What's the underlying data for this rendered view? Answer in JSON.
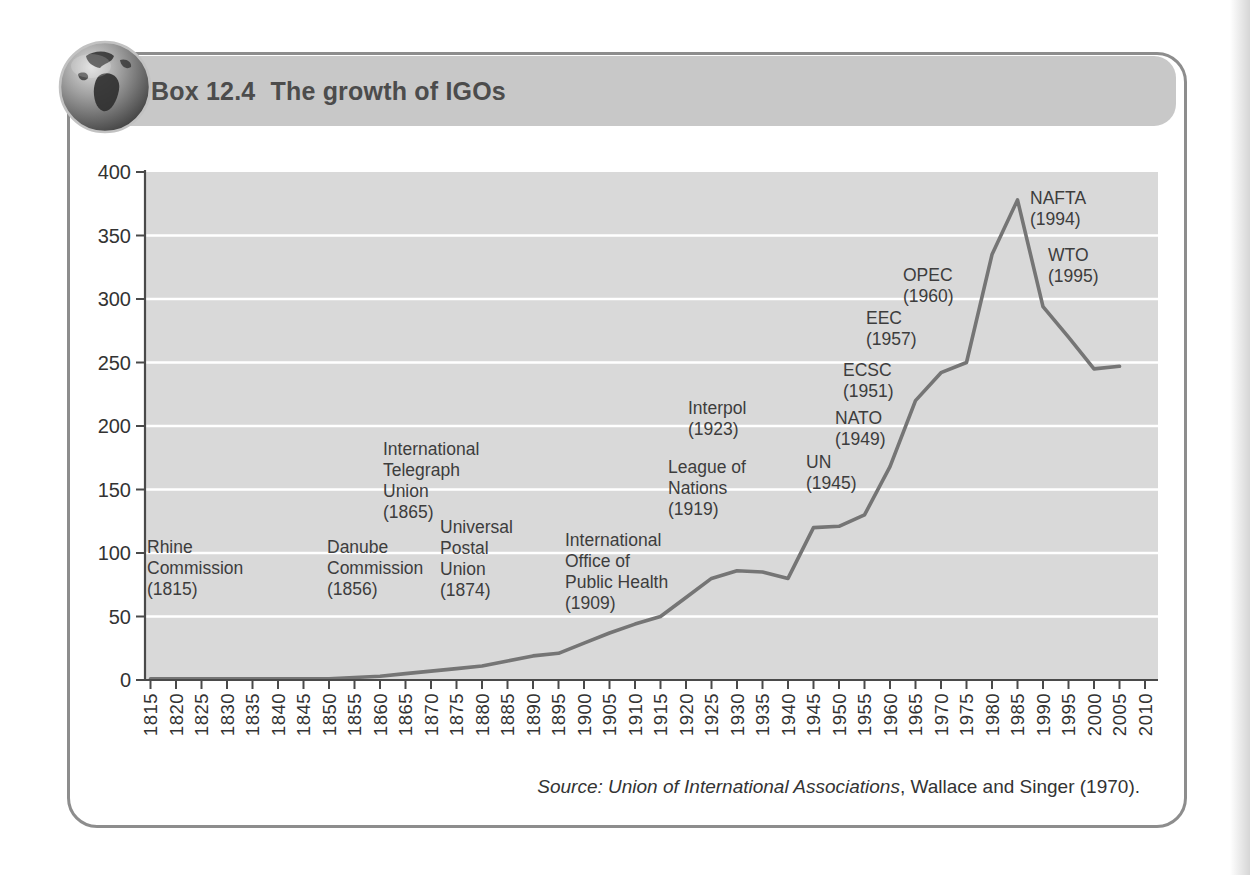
{
  "header": {
    "box_label": "Box 12.4",
    "title": "The growth of IGOs",
    "icon": "globe-icon"
  },
  "source": {
    "italic_part": "Source: Union of International Associations",
    "regular_part": ", Wallace and Singer (1970)."
  },
  "colors": {
    "band": "#c8c8c8",
    "box_border": "#8d8d8d",
    "title_text": "#4c4c4c",
    "plot_bg": "#d9d9d9",
    "gridline": "#ffffff",
    "axis": "#4a4a4a",
    "tick_text": "#333333",
    "line": "#757575",
    "annotation_text": "#3d3d3d",
    "source_text": "#333333"
  },
  "chart_data": {
    "type": "line",
    "title": "The growth of IGOs",
    "xlabel": "",
    "ylabel": "",
    "xlim": [
      1815,
      2010
    ],
    "ylim": [
      0,
      400
    ],
    "grid": "horizontal white gridlines every 50",
    "legend": "none",
    "y_ticks": [
      0,
      50,
      100,
      150,
      200,
      250,
      300,
      350,
      400
    ],
    "x_tick_labels": [
      "1815",
      "1820",
      "1825",
      "1830",
      "1835",
      "1840",
      "1845",
      "1850",
      "1855",
      "1860",
      "1865",
      "1870",
      "1875",
      "1880",
      "1885",
      "1890",
      "1895",
      "1900",
      "1905",
      "1910",
      "1915",
      "1920",
      "1925",
      "1930",
      "1935",
      "1940",
      "1945",
      "1950",
      "1955",
      "1960",
      "1965",
      "1970",
      "1975",
      "1980",
      "1985",
      "1990",
      "1995",
      "2000",
      "2005",
      "2010"
    ],
    "x": [
      1815,
      1820,
      1825,
      1830,
      1835,
      1840,
      1845,
      1850,
      1855,
      1860,
      1865,
      1870,
      1875,
      1880,
      1885,
      1890,
      1895,
      1900,
      1905,
      1910,
      1915,
      1920,
      1925,
      1930,
      1935,
      1940,
      1945,
      1950,
      1955,
      1960,
      1965,
      1970,
      1975,
      1980,
      1985,
      1990,
      1995,
      2000,
      2005
    ],
    "values": [
      1,
      1,
      1,
      1,
      1,
      1,
      1,
      1,
      2,
      3,
      5,
      7,
      9,
      11,
      15,
      19,
      21,
      29,
      37,
      44,
      50,
      65,
      80,
      86,
      85,
      80,
      120,
      121,
      130,
      168,
      220,
      242,
      250,
      335,
      378,
      294,
      270,
      245,
      247
    ],
    "annotations": [
      {
        "label": "Rhine Commission (1815)",
        "lines": [
          "Rhine",
          "Commission",
          "(1815)"
        ],
        "x": 147,
        "y": 553
      },
      {
        "label": "Danube Commission (1856)",
        "lines": [
          "Danube",
          "Commission",
          "(1856)"
        ],
        "x": 327,
        "y": 553
      },
      {
        "label": "International Telegraph Union (1865)",
        "lines": [
          "International",
          "Telegraph",
          "Union",
          "(1865)"
        ],
        "x": 383,
        "y": 455
      },
      {
        "label": "Universal Postal Union (1874)",
        "lines": [
          "Universal",
          "Postal",
          "Union",
          "(1874)"
        ],
        "x": 440,
        "y": 533
      },
      {
        "label": "International Office of Public Health (1909)",
        "lines": [
          "International",
          "Office of",
          "Public Health",
          "(1909)"
        ],
        "x": 565,
        "y": 546
      },
      {
        "label": "League of Nations (1919)",
        "lines": [
          "League of",
          "Nations",
          "(1919)"
        ],
        "x": 668,
        "y": 473
      },
      {
        "label": "Interpol (1923)",
        "lines": [
          "Interpol",
          "(1923)"
        ],
        "x": 688,
        "y": 414
      },
      {
        "label": "UN (1945)",
        "lines": [
          "UN",
          "(1945)"
        ],
        "x": 806,
        "y": 468
      },
      {
        "label": "NATO (1949)",
        "lines": [
          "NATO",
          "(1949)"
        ],
        "x": 835,
        "y": 424
      },
      {
        "label": "ECSC (1951)",
        "lines": [
          "ECSC",
          "(1951)"
        ],
        "x": 843,
        "y": 376
      },
      {
        "label": "EEC (1957)",
        "lines": [
          "EEC",
          "(1957)"
        ],
        "x": 866,
        "y": 324
      },
      {
        "label": "OPEC (1960)",
        "lines": [
          "OPEC",
          "(1960)"
        ],
        "x": 903,
        "y": 281
      },
      {
        "label": "NAFTA (1994)",
        "lines": [
          "NAFTA",
          "(1994)"
        ],
        "x": 1030,
        "y": 204
      },
      {
        "label": "WTO (1995)",
        "lines": [
          "WTO",
          "(1995)"
        ],
        "x": 1048,
        "y": 261
      }
    ]
  }
}
